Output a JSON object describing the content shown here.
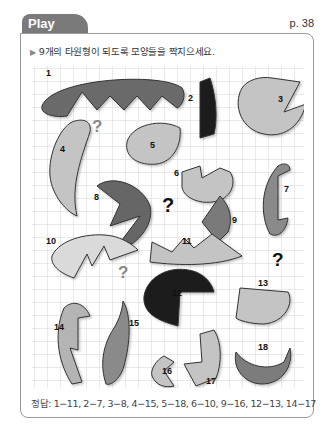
{
  "header": {
    "tab_label": "Play Time",
    "page_number": "p. 38"
  },
  "instruction": {
    "bullet": "▶",
    "text": "9개의 타원형이 되도록 모양들을 짝지으세요."
  },
  "puzzle": {
    "grid": {
      "cell_size": 13,
      "line_color": "#d8d8d8"
    },
    "colors": {
      "light": "#c4c4c4",
      "lighter": "#d9d9d9",
      "mid": "#9a9a9a",
      "dark": "#666666",
      "black": "#1a1a1a",
      "outline": "#333333"
    },
    "shape_labels": [
      "1",
      "2",
      "3",
      "4",
      "5",
      "6",
      "7",
      "8",
      "9",
      "10",
      "11",
      "12",
      "13",
      "14",
      "15",
      "16",
      "17",
      "18"
    ],
    "question_mark": "?"
  },
  "answer": {
    "label": "정답:",
    "text": "1−11, 2−7, 3−8, 4−15, 5−18, 6−10, 9−16, 12−13, 14−17"
  }
}
